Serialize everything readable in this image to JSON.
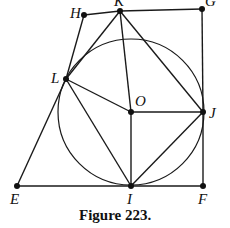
{
  "figure": {
    "caption": "Figure 223.",
    "points": {
      "H": {
        "label": "H",
        "x": 84,
        "y": 15
      },
      "K": {
        "label": "K",
        "x": 120,
        "y": 11
      },
      "G": {
        "label": "G",
        "x": 202,
        "y": 9
      },
      "L": {
        "label": "L",
        "x": 66,
        "y": 79
      },
      "O": {
        "label": "O",
        "x": 131,
        "y": 112
      },
      "J": {
        "label": "J",
        "x": 203,
        "y": 112
      },
      "E": {
        "label": "E",
        "x": 17,
        "y": 186
      },
      "I": {
        "label": "I",
        "x": 131,
        "y": 186
      },
      "F": {
        "label": "F",
        "x": 203,
        "y": 186
      }
    },
    "circle": {
      "center": "O",
      "radius": 73
    },
    "segments": [
      [
        "H",
        "K"
      ],
      [
        "K",
        "G"
      ],
      [
        "G",
        "J"
      ],
      [
        "J",
        "F"
      ],
      [
        "F",
        "I"
      ],
      [
        "I",
        "E"
      ],
      [
        "E",
        "L"
      ],
      [
        "L",
        "H"
      ],
      [
        "L",
        "K"
      ],
      [
        "K",
        "O"
      ],
      [
        "K",
        "J"
      ],
      [
        "L",
        "O"
      ],
      [
        "O",
        "J"
      ],
      [
        "O",
        "I"
      ],
      [
        "L",
        "I"
      ],
      [
        "I",
        "J"
      ]
    ]
  }
}
